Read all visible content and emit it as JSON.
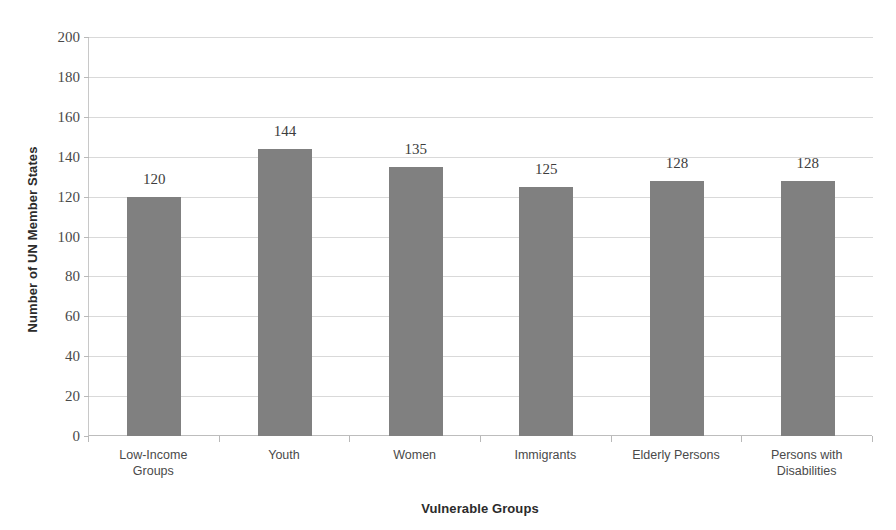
{
  "chart_data": {
    "type": "bar",
    "title": "",
    "xlabel": "Vulnerable Groups",
    "ylabel": "Number of UN Member States",
    "categories": [
      "Low-Income Groups",
      "Youth",
      "Women",
      "Immigrants",
      "Elderly Persons",
      "Persons with Disabilities"
    ],
    "category_lines": [
      [
        "Low-Income",
        "Groups"
      ],
      [
        "Youth"
      ],
      [
        "Women"
      ],
      [
        "Immigrants"
      ],
      [
        "Elderly Persons"
      ],
      [
        "Persons with",
        "Disabilities"
      ]
    ],
    "values": [
      120,
      144,
      135,
      125,
      128,
      128
    ],
    "data_labels": [
      "120",
      "144",
      "135",
      "125",
      "128",
      "128"
    ],
    "ylim": [
      0,
      200
    ],
    "ytick_step": 20,
    "ytick_labels": [
      "200",
      "180",
      "160",
      "140",
      "120",
      "100",
      "80",
      "60",
      "40",
      "20",
      "0"
    ],
    "ytick_values": [
      200,
      180,
      160,
      140,
      120,
      100,
      80,
      60,
      40,
      20,
      0
    ],
    "grid": true,
    "legend": false,
    "legend_position": "none",
    "bar_color": "#808080",
    "gridline_color": "#d9d9d9",
    "axis_color": "#bdbdbd",
    "background_color": "#ffffff",
    "text_color": "#4a4a4a"
  }
}
